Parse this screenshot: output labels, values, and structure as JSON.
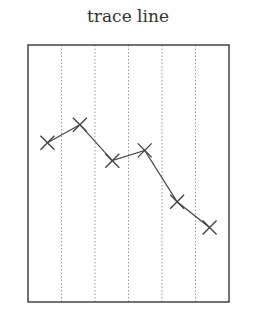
{
  "chart_data": {
    "type": "line",
    "title": "trace line",
    "xlabel": "",
    "ylabel": "",
    "x": [
      1,
      2,
      3,
      4,
      5,
      6
    ],
    "series": [
      {
        "name": "trace line",
        "values": [
          0.62,
          0.69,
          0.55,
          0.59,
          0.39,
          0.29
        ],
        "marker": "x"
      }
    ],
    "xlim": [
      0.4,
      6.6
    ],
    "ylim": [
      0,
      1
    ],
    "grid": {
      "vertical": true,
      "horizontal": false,
      "style": "dotted"
    },
    "vertical_gridlines": 5,
    "legend": "none",
    "colors": {
      "line": "#444444",
      "frame": "#444444",
      "grid": "#999999"
    }
  }
}
